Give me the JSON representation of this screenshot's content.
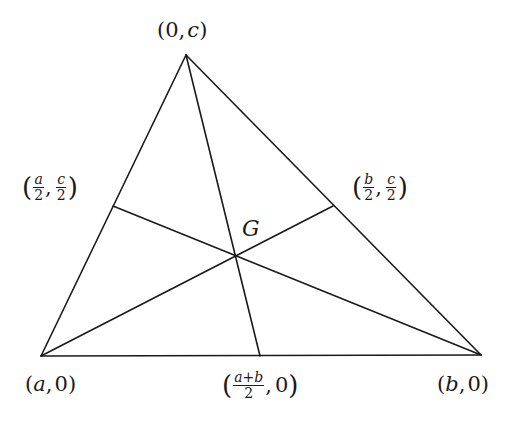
{
  "diagram": {
    "title": "",
    "stroke_color": "#1a1a1a",
    "background": "#ffffff",
    "vertices": {
      "top": {
        "x": 186,
        "y": 55
      },
      "bottom_left": {
        "x": 41,
        "y": 356
      },
      "bottom_right": {
        "x": 481,
        "y": 355
      }
    },
    "midpoints": {
      "left": {
        "x": 113,
        "y": 206
      },
      "right": {
        "x": 333,
        "y": 206
      },
      "bottom": {
        "x": 260,
        "y": 356
      }
    },
    "centroid": {
      "x": 236,
      "y": 256
    },
    "labels": {
      "top": {
        "open": "(",
        "first": "0",
        "sep": ",",
        "second": "c",
        "close": ")"
      },
      "bottom_left": {
        "open": "(",
        "first": "a",
        "sep": ",",
        "second": "0",
        "close": ")"
      },
      "bottom_right": {
        "open": "(",
        "first": "b",
        "sep": ",",
        "second": "0",
        "close": ")"
      },
      "mid_left": {
        "open": "(",
        "num1": "a",
        "den1": "2",
        "sep": ",",
        "num2": "c",
        "den2": "2",
        "close": ")"
      },
      "mid_right": {
        "open": "(",
        "num1": "b",
        "den1": "2",
        "sep": ",",
        "num2": "c",
        "den2": "2",
        "close": ")"
      },
      "mid_bottom": {
        "open": "(",
        "num1": "a+b",
        "den1": "2",
        "sep": ",",
        "second": "0",
        "close": ")"
      },
      "centroid": "G"
    }
  }
}
